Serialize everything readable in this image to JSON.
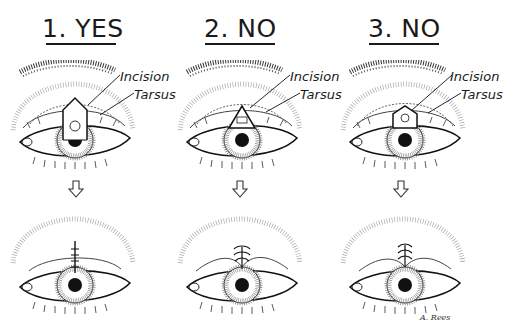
{
  "figure": {
    "columns": [
      {
        "title": "1. YES",
        "label_incision": "Incision",
        "label_tarsus": "Tarsus",
        "incision_shape": "pentagon (house-shaped, extends above tarsus)",
        "closure": "vertical linear suture line"
      },
      {
        "title": "2. NO",
        "label_incision": "Incision",
        "label_tarsus": "Tarsus",
        "incision_shape": "triangle",
        "closure": "puckered lid with notch"
      },
      {
        "title": "3. NO",
        "label_incision": "Incision",
        "label_tarsus": "Tarsus",
        "incision_shape": "pentagon (confined within tarsus)",
        "closure": "puckered lid with notch"
      }
    ],
    "signature": "A. Rees",
    "arrow_icon": "down-arrow-outline"
  }
}
